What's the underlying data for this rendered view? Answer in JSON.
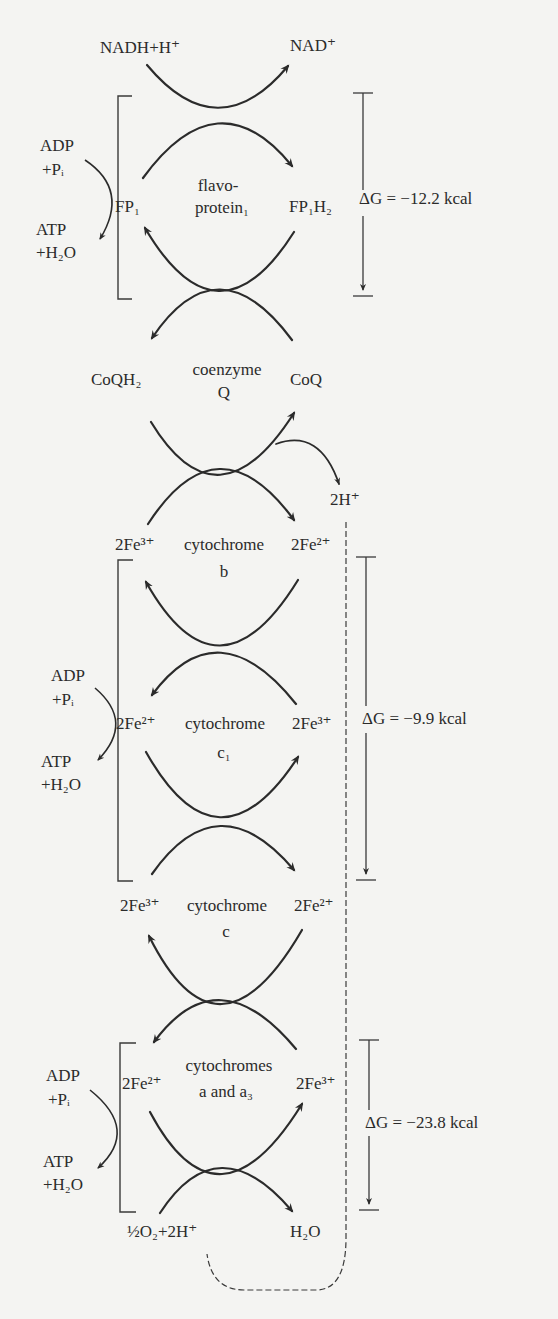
{
  "diagram": {
    "type": "electron-transport-chain",
    "carriers": [
      {
        "name": "flavoprotein_1",
        "label_line1": "flavo-",
        "label_line2": "protein₁",
        "left": "FP₁",
        "right": "FP₁H₂"
      },
      {
        "name": "coenzyme_q",
        "label_line1": "coenzyme",
        "label_line2": "Q",
        "left": "CoQH₂",
        "right": "CoQ"
      },
      {
        "name": "cytochrome_b",
        "label_line1": "cytochrome",
        "label_line2": "b",
        "left": "2Fe³⁺",
        "right": "2Fe²⁺"
      },
      {
        "name": "cytochrome_c1",
        "label_line1": "cytochrome",
        "label_line2": "c₁",
        "left": "2Fe²⁺",
        "right": "2Fe³⁺"
      },
      {
        "name": "cytochrome_c",
        "label_line1": "cytochrome",
        "label_line2": "c",
        "left": "2Fe³⁺",
        "right": "2Fe²⁺"
      },
      {
        "name": "cytochromes_a_a3",
        "label_line1": "cytochromes",
        "label_line2": "a and a₃",
        "left": "2Fe²⁺",
        "right": "2Fe³⁺"
      }
    ],
    "top_left": "NADH+H⁺",
    "top_right": "NAD⁺",
    "proton_release": "2H⁺",
    "bottom_left": "½O₂+2H⁺",
    "bottom_right": "H₂O",
    "phosphorylation": {
      "adp": "ADP",
      "pi": "+Pᵢ",
      "atp": "ATP",
      "h2o": "+H₂O"
    },
    "energy_drops": [
      {
        "label": "ΔG = −12.2 kcal",
        "value_kcal": -12.2
      },
      {
        "label": "ΔG = −9.9 kcal",
        "value_kcal": -9.9
      },
      {
        "label": "ΔG = −23.8 kcal",
        "value_kcal": -23.8
      }
    ]
  }
}
